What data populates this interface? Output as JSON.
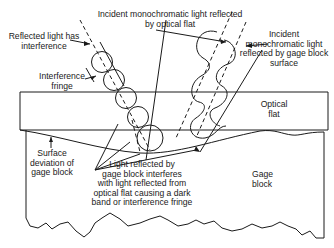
{
  "diagram": {
    "type": "optical-flat-interference",
    "labels": {
      "incident_flat": [
        "Incident monochromatic light reflected",
        "by optical flat"
      ],
      "reflected_interference": [
        "Reflected light has",
        "interference"
      ],
      "incident_gage": [
        "Incident",
        "monochromatic light",
        "reflected by gage block",
        "surface"
      ],
      "interference_fringe": [
        "Interference",
        "fringe"
      ],
      "optical_flat": [
        "Optical",
        "flat"
      ],
      "surface_deviation": [
        "Surface",
        "deviation of",
        "gage block"
      ],
      "light_reflected_note": [
        "Light reflected by",
        "gage block interferes",
        "with light reflected from",
        "optical flat causing a dark",
        "band or interference fringe"
      ],
      "gage_block": [
        "Gage",
        "block"
      ]
    },
    "colors": {
      "line": "#1a1a1a",
      "background": "#ffffff"
    }
  }
}
